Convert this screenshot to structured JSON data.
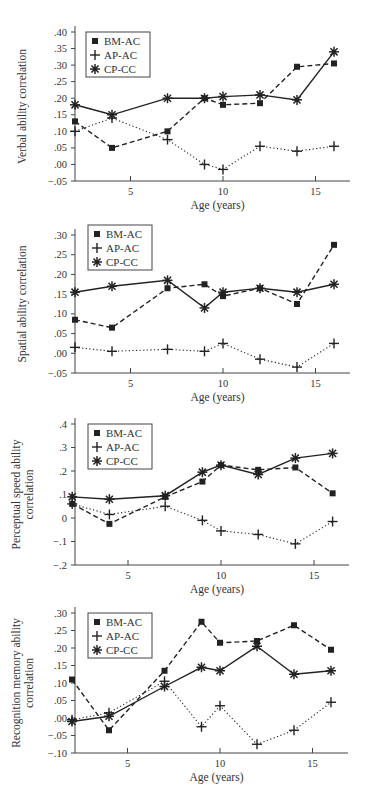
{
  "figure": {
    "x_axis_label": "Age (years)",
    "legend": [
      {
        "label": "BM-AC",
        "marker": "square",
        "line": "dashed"
      },
      {
        "label": "AP-AC",
        "marker": "plus",
        "line": "dotted"
      },
      {
        "label": "CP-CC",
        "marker": "asterisk",
        "line": "solid"
      }
    ],
    "colors": {
      "line": "#222222",
      "axis": "#444444",
      "text": "#333333"
    }
  },
  "chart_data": [
    {
      "type": "line",
      "title": "",
      "xlabel": "Age (years)",
      "ylabel": "Verbal ability correlation",
      "x_ticks": [
        5,
        10,
        15
      ],
      "y_ticks": [
        -0.05,
        0.0,
        0.05,
        0.1,
        0.15,
        0.2,
        0.25,
        0.3,
        0.35,
        0.4
      ],
      "y_tick_labels": [
        "−.05",
        ".00",
        ".05",
        ".10",
        ".15",
        ".20",
        ".25",
        ".30",
        ".35",
        ".40"
      ],
      "ylim": [
        -0.05,
        0.4
      ],
      "xlim": [
        2,
        17.8
      ],
      "grid": false,
      "legend_position": "upper left",
      "x": [
        2,
        4,
        7,
        9,
        10,
        12,
        14,
        16
      ],
      "series": [
        {
          "name": "BM-AC",
          "values": [
            0.13,
            0.05,
            0.1,
            0.2,
            0.18,
            0.185,
            0.295,
            0.305
          ]
        },
        {
          "name": "AP-AC",
          "values": [
            0.1,
            0.14,
            0.075,
            0.0,
            -0.015,
            0.055,
            0.04,
            0.055
          ]
        },
        {
          "name": "CP-CC",
          "values": [
            0.18,
            0.15,
            0.2,
            0.2,
            0.205,
            0.21,
            0.195,
            0.34
          ]
        }
      ]
    },
    {
      "type": "line",
      "title": "",
      "xlabel": "Age (years)",
      "ylabel": "Spatial ability correlation",
      "x_ticks": [
        5,
        10,
        15
      ],
      "y_ticks": [
        -0.05,
        0.0,
        0.05,
        0.1,
        0.15,
        0.2,
        0.25,
        0.3
      ],
      "y_tick_labels": [
        "−.05",
        ".00",
        ".05",
        ".10",
        ".15",
        ".20",
        ".25",
        ".30"
      ],
      "ylim": [
        -0.05,
        0.3
      ],
      "xlim": [
        2,
        17.8
      ],
      "grid": false,
      "legend_position": "upper left",
      "x": [
        2,
        4,
        7,
        9,
        10,
        12,
        14,
        16
      ],
      "series": [
        {
          "name": "BM-AC",
          "values": [
            0.085,
            0.065,
            0.165,
            0.175,
            0.145,
            0.165,
            0.125,
            0.275
          ]
        },
        {
          "name": "AP-AC",
          "values": [
            0.015,
            0.005,
            0.01,
            0.005,
            0.025,
            -0.015,
            -0.035,
            0.025
          ]
        },
        {
          "name": "CP-CC",
          "values": [
            0.155,
            0.17,
            0.185,
            0.115,
            0.155,
            0.165,
            0.155,
            0.175
          ]
        }
      ]
    },
    {
      "type": "line",
      "title": "",
      "xlabel": "Age (years)",
      "ylabel": "Perceptual speed ability correlation",
      "x_ticks": [
        5,
        10,
        15
      ],
      "y_ticks": [
        -0.2,
        -0.1,
        0,
        0.1,
        0.2,
        0.3,
        0.4
      ],
      "y_tick_labels": [
        "−.2",
        "−.1",
        "0",
        ".1",
        ".2",
        ".3",
        ".4"
      ],
      "ylim": [
        -0.2,
        0.4
      ],
      "xlim": [
        2,
        17.8
      ],
      "grid": false,
      "legend_position": "upper left",
      "x": [
        2,
        4,
        7,
        9,
        10,
        12,
        14,
        16
      ],
      "series": [
        {
          "name": "BM-AC",
          "values": [
            0.06,
            -0.025,
            0.09,
            0.155,
            0.225,
            0.205,
            0.215,
            0.105
          ]
        },
        {
          "name": "AP-AC",
          "values": [
            0.06,
            0.015,
            0.05,
            -0.01,
            -0.055,
            -0.07,
            -0.11,
            -0.015
          ]
        },
        {
          "name": "CP-CC",
          "values": [
            0.09,
            0.08,
            0.095,
            0.195,
            0.225,
            0.185,
            0.255,
            0.275
          ]
        }
      ]
    },
    {
      "type": "line",
      "title": "",
      "xlabel": "Age (years)",
      "ylabel": "Recognition memory ability correlation",
      "x_ticks": [
        5,
        10,
        15
      ],
      "y_ticks": [
        -0.1,
        -0.05,
        0.0,
        0.05,
        0.1,
        0.15,
        0.2,
        0.25,
        0.3
      ],
      "y_tick_labels": [
        "−.10",
        "−.05",
        ".00",
        ".05",
        ".10",
        ".15",
        ".20",
        ".25",
        ".30"
      ],
      "ylim": [
        -0.1,
        0.3
      ],
      "xlim": [
        2,
        17.8
      ],
      "grid": false,
      "legend_position": "upper left",
      "x": [
        2,
        4,
        7,
        9,
        10,
        12,
        14,
        16
      ],
      "series": [
        {
          "name": "BM-AC",
          "values": [
            0.11,
            -0.035,
            0.135,
            0.275,
            0.215,
            0.22,
            0.265,
            0.195
          ]
        },
        {
          "name": "AP-AC",
          "values": [
            -0.005,
            0.015,
            0.105,
            -0.025,
            0.035,
            -0.075,
            -0.035,
            0.045
          ]
        },
        {
          "name": "CP-CC",
          "values": [
            -0.01,
            0.005,
            0.09,
            0.145,
            0.135,
            0.205,
            0.125,
            0.135
          ]
        }
      ]
    }
  ],
  "panels": [
    {
      "ylabel_lines": [
        "Verbal ability correlation"
      ]
    },
    {
      "ylabel_lines": [
        "Spatial ability correlation"
      ]
    },
    {
      "ylabel_lines": [
        "Perceptual speed ability",
        "correlation"
      ]
    },
    {
      "ylabel_lines": [
        "Recognition memory ability",
        "correlation"
      ]
    }
  ]
}
